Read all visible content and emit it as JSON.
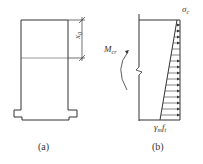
{
  "figure_a": {
    "caption": "(a)",
    "dimension_label": "x",
    "dimension_sub": "0"
  },
  "figure_b": {
    "caption": "(b)",
    "top_stress_label": "σ",
    "top_stress_sub": "c",
    "bottom_stress_gamma": "γ",
    "bottom_stress_gamma_sub": "m",
    "bottom_stress_f": "f",
    "bottom_stress_f_sub": "t",
    "moment_label": "M",
    "moment_sub": "cr"
  },
  "colors": {
    "line": "#333333",
    "background": "#ffffff"
  }
}
